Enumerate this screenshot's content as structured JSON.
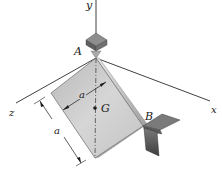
{
  "figure": {
    "type": "mechanics-diagram",
    "axes": {
      "x_label": "x",
      "y_label": "y",
      "z_label": "z"
    },
    "points": {
      "A_label": "A",
      "B_label": "B",
      "G_label": "G"
    },
    "dimensions": {
      "width_label": "a",
      "height_label": "a"
    },
    "colors": {
      "plate_face": "#c9c9c9",
      "plate_edge": "#9a9a9a",
      "support_dark": "#5a5a5a",
      "support_light": "#8c8c8c",
      "line": "#2a2a2a"
    }
  }
}
